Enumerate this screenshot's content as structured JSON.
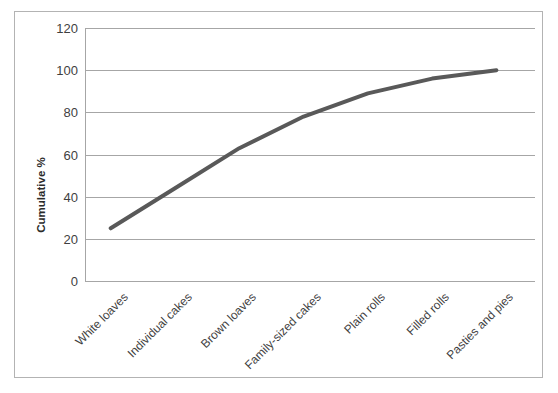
{
  "chart_data": {
    "type": "line",
    "title": "",
    "xlabel": "",
    "ylabel": "Cumulative %",
    "categories": [
      "White loaves",
      "Individual cakes",
      "Brown loaves",
      "Family-sized cakes",
      "Plain rolls",
      "Filled rolls",
      "Pasties and pies"
    ],
    "values": [
      25,
      44,
      63,
      78,
      89,
      96,
      100
    ],
    "ylim": [
      0,
      120
    ],
    "yticks": [
      0,
      20,
      40,
      60,
      80,
      100,
      120
    ],
    "ytick_labels": [
      "0",
      "20",
      "40",
      "60",
      "80",
      "100",
      "120"
    ],
    "grid": true,
    "legend": false,
    "series_color": "#595959",
    "gridline_color": "#a6a6a6",
    "border_color": "#b3b3b3",
    "text_color": "#3f3f3f",
    "xlabel_rotation_deg": -45,
    "line_width_px": 4
  }
}
